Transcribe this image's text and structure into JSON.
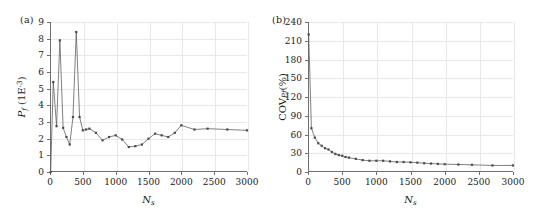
{
  "figure": {
    "panels": [
      {
        "tag": "(a)",
        "xlabel": "N",
        "xlabel_sub": "s",
        "ylabel_main": "P",
        "ylabel_sub": "f",
        "ylabel_unit": "(1E",
        "ylabel_exp": "-3",
        "ylabel_close": ")",
        "xticks": [
          "0",
          "500",
          "1000",
          "1500",
          "2000",
          "2500",
          "3000"
        ],
        "yticks": [
          "0",
          "1",
          "2",
          "3",
          "4",
          "5",
          "6",
          "7",
          "8",
          "9"
        ]
      },
      {
        "tag": "(b)",
        "xlabel": "N",
        "xlabel_sub": "s",
        "ylabel_main": "COV",
        "ylabel_sub": "Pf",
        "ylabel_unit": "(%)",
        "xticks": [
          "0",
          "500",
          "1000",
          "1500",
          "2000",
          "2500",
          "3000"
        ],
        "yticks": [
          "0",
          "30",
          "60",
          "90",
          "120",
          "150",
          "180",
          "210",
          "240"
        ]
      }
    ],
    "colors": {
      "line": "#5f5f5f",
      "marker": "#4a4a4a",
      "grid": "#e8e8e8",
      "axis": "#6f6f6f",
      "text": "#1a1a1a",
      "background": "#ffffff"
    }
  },
  "chart_data": [
    {
      "type": "line",
      "title": "(a)",
      "xlabel": "N_s",
      "ylabel": "P_f (1E-3)",
      "xlim": [
        0,
        3000
      ],
      "ylim": [
        0,
        9
      ],
      "xticks": [
        0,
        500,
        1000,
        1500,
        2000,
        2500,
        3000
      ],
      "yticks": [
        0,
        1,
        2,
        3,
        4,
        5,
        6,
        7,
        8,
        9
      ],
      "grid": true,
      "legend": "none",
      "marker": "square",
      "x": [
        10,
        50,
        100,
        150,
        200,
        250,
        300,
        350,
        400,
        450,
        500,
        550,
        600,
        700,
        800,
        900,
        1000,
        1100,
        1200,
        1300,
        1400,
        1500,
        1600,
        1700,
        1800,
        1900,
        2000,
        2200,
        2400,
        2700,
        3000
      ],
      "y": [
        0.0,
        5.4,
        2.75,
        7.9,
        2.65,
        2.1,
        1.65,
        3.3,
        8.4,
        3.3,
        2.5,
        2.55,
        2.6,
        2.35,
        1.9,
        2.1,
        2.2,
        1.95,
        1.5,
        1.55,
        1.65,
        2.0,
        2.3,
        2.2,
        2.1,
        2.35,
        2.8,
        2.55,
        2.6,
        2.55,
        2.5
      ]
    },
    {
      "type": "line",
      "title": "(b)",
      "xlabel": "N_s",
      "ylabel": "COV_Pf (%)",
      "xlim": [
        0,
        3000
      ],
      "ylim": [
        0,
        240
      ],
      "xticks": [
        0,
        500,
        1000,
        1500,
        2000,
        2500,
        3000
      ],
      "yticks": [
        0,
        30,
        60,
        90,
        120,
        150,
        180,
        210,
        240
      ],
      "grid": true,
      "legend": "none",
      "marker": "square",
      "x": [
        10,
        50,
        100,
        150,
        200,
        250,
        300,
        350,
        400,
        450,
        500,
        550,
        600,
        700,
        800,
        900,
        1000,
        1100,
        1200,
        1300,
        1400,
        1500,
        1600,
        1700,
        1800,
        1900,
        2000,
        2200,
        2400,
        2700,
        3000
      ],
      "y": [
        220,
        70,
        55,
        46,
        42,
        38,
        36,
        32,
        29,
        27,
        26,
        24,
        23,
        21,
        19,
        18,
        18,
        18,
        17,
        16,
        16,
        15.5,
        15,
        14,
        13.5,
        13,
        12.5,
        12,
        11.5,
        10.5,
        10.5
      ]
    }
  ]
}
